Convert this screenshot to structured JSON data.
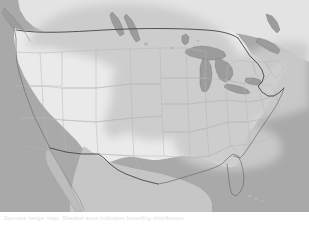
{
  "figure": {
    "caption": "Species range map. Shaded area indicates breeding distribution.",
    "colors": {
      "ocean": "#a9a9a9",
      "land_unshaded": "#fdfdfd",
      "land_shaded": "#e9e9e9",
      "range_overlay": "#cfcfcf",
      "lake": "#a0a0a0",
      "state_border": "#b4b4b4",
      "national_border": "#4a4a4a",
      "coastline": "#6f6f6f",
      "caption_text": "#e2e2e2",
      "background": "#ffffff"
    },
    "legend": {
      "range_label": "Range",
      "outside_range_label": "Outside range"
    },
    "regions": {
      "ocean_label": "Ocean",
      "great_lakes_label": "Great Lakes",
      "range_area_label": "Shaded range",
      "unshaded_area_label": "Unshaded area",
      "canada_label": "Canada",
      "mexico_label": "Mexico",
      "united_states_label": "United States"
    },
    "dimensions": {
      "width": "309",
      "height": "230"
    }
  }
}
